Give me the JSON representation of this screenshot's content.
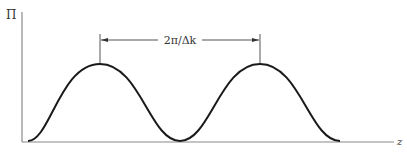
{
  "diagram": {
    "y_axis_label": "Π",
    "x_axis_label": "z",
    "period_annotation": "2π/Δk",
    "colors": {
      "curve": "#1a1a1a",
      "axis": "#8a8a8a",
      "annotation": "#555555",
      "text": "#333333"
    },
    "curve": {
      "type": "sinusoidal",
      "start_x": 28,
      "end_x": 340,
      "baseline_y": 141,
      "peak_y": 64,
      "peaks_x": [
        100,
        260
      ],
      "trough_x": [
        180
      ]
    },
    "period_marker": {
      "left_x": 100,
      "right_x": 260,
      "y": 40
    }
  }
}
